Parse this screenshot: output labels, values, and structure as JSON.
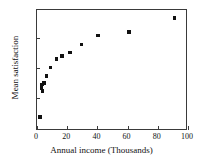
{
  "chart_data": {
    "type": "scatter",
    "title": "",
    "xlabel": "Annual income (Thousands)",
    "ylabel": "Mean satisfaction",
    "xlim": [
      0,
      100
    ],
    "ylim": [
      0,
      1
    ],
    "grid": false,
    "legend": null,
    "xticks": [
      0,
      20,
      40,
      60,
      80,
      100
    ],
    "xtick_labels": [
      "0",
      "20",
      "40",
      "60",
      "80",
      "100"
    ],
    "yticks": [
      0.27,
      0.52,
      0.77
    ],
    "ytick_labels": [
      "",
      "",
      ""
    ],
    "marker": "square",
    "marker_color": "#111111",
    "points": [
      {
        "x": 2.0,
        "y": 0.115
      },
      {
        "x": 3.0,
        "y": 0.355
      },
      {
        "x": 3.4,
        "y": 0.385
      },
      {
        "x": 3.8,
        "y": 0.33
      },
      {
        "x": 4.6,
        "y": 0.395
      },
      {
        "x": 6.2,
        "y": 0.455
      },
      {
        "x": 9.0,
        "y": 0.525
      },
      {
        "x": 13.0,
        "y": 0.595
      },
      {
        "x": 16.5,
        "y": 0.62
      },
      {
        "x": 22.0,
        "y": 0.65
      },
      {
        "x": 29.5,
        "y": 0.715
      },
      {
        "x": 40.5,
        "y": 0.79
      },
      {
        "x": 61.0,
        "y": 0.82
      },
      {
        "x": 91.0,
        "y": 0.935
      }
    ]
  }
}
